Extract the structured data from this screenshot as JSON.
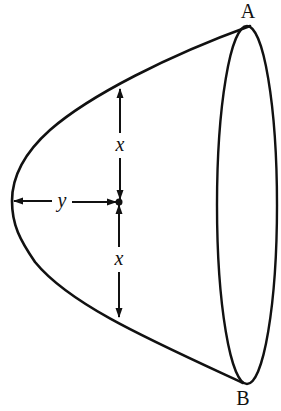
{
  "figure": {
    "type": "paraboloid-of-revolution",
    "stroke_color": "#111111",
    "background_color": "#ffffff",
    "labels": {
      "point_top": "A",
      "point_bottom": "B",
      "upper_distance": "x",
      "lower_distance": "x",
      "axial_distance": "y"
    }
  }
}
